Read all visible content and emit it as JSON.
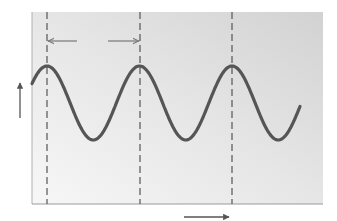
{
  "diagram": {
    "type": "wave-period-illustration",
    "colors": {
      "background": "#ffffff",
      "panel_light": "#f4f4f4",
      "panel_dark": "#d6d6d6",
      "wave": "#555555",
      "dashed_line": "#555555",
      "arrow": "#666666",
      "border": "#9a9a9a"
    },
    "panel": {
      "x": 32,
      "y": 12,
      "width": 291,
      "height": 192
    },
    "wave": {
      "crest_x": [
        47,
        140,
        232
      ],
      "crest_y": 66,
      "trough_y": 140,
      "trough_x": [
        93,
        186,
        278
      ],
      "start": {
        "x": 32,
        "y": 76
      },
      "end": {
        "x": 300,
        "y": 106
      }
    },
    "dashed_lines_x": [
      47,
      140,
      232
    ],
    "period_arrow": {
      "y": 41,
      "left_tip_x": 47,
      "left_tail_x": 77,
      "right_tail_x": 108,
      "right_tip_x": 140
    },
    "vertical_axis_arrow": {
      "x": 20,
      "y_top": 83,
      "y_bottom": 118,
      "direction": "up"
    },
    "horizontal_axis_arrow": {
      "y": 217,
      "x_left": 184,
      "x_right": 229,
      "direction": "right"
    }
  }
}
